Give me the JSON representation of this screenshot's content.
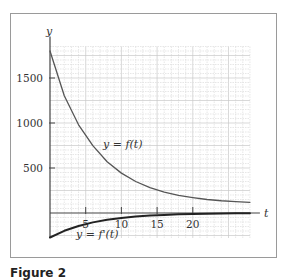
{
  "caption": "Figure 2",
  "chart_data": {
    "type": "line",
    "title": "",
    "xlabel": "t",
    "ylabel": "y",
    "xlim": [
      0,
      28
    ],
    "ylim": [
      -300,
      1850
    ],
    "grid": true,
    "x_ticks": [
      5,
      10,
      15,
      20
    ],
    "x_tick_labels": [
      "5",
      "10",
      "15",
      "20"
    ],
    "y_ticks": [
      500,
      1000,
      1500
    ],
    "y_tick_labels": [
      "500",
      "1000",
      "1500"
    ],
    "series": [
      {
        "name": "y = f(t)",
        "label": "y = f(t)",
        "x": [
          0,
          2,
          4,
          6,
          8,
          10,
          12,
          14,
          16,
          18,
          20,
          22,
          24,
          26,
          28
        ],
        "values": [
          1800,
          1303,
          980,
          748,
          569,
          443,
          350,
          282,
          233,
          197,
          172,
          150,
          136,
          126,
          119
        ]
      },
      {
        "name": "y = f'(t)",
        "label": "y = f'(t)",
        "x": [
          0,
          2,
          4,
          6,
          8,
          10,
          12,
          14,
          16,
          18,
          20,
          22,
          24,
          26,
          28
        ],
        "values": [
          -272,
          -198,
          -144,
          -104,
          -76,
          -55,
          -40,
          -29,
          -21,
          -15,
          -11,
          -8,
          -6,
          -4,
          -3
        ]
      }
    ]
  }
}
